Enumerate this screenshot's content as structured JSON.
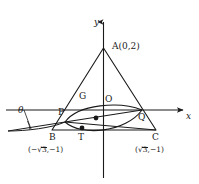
{
  "figure": {
    "axes": {
      "x_label": "x",
      "y_label": "y",
      "x_axis_y": 110,
      "y_axis_x": 103.5
    },
    "points": [
      {
        "id": "A",
        "label": "A(0,2)",
        "px": 103.5,
        "py": 48,
        "label_x": 112,
        "label_y": 42,
        "dot": false
      },
      {
        "id": "B",
        "label": "B",
        "px": 52,
        "py": 130,
        "label_x": 49,
        "label_y": 133,
        "dot": false
      },
      {
        "id": "C",
        "label": "C",
        "px": 156,
        "py": 130,
        "label_x": 152,
        "label_y": 133,
        "dot": false
      },
      {
        "id": "P",
        "label": "P",
        "px": 65,
        "py": 122,
        "label_x": 58,
        "label_y": 108,
        "dot": false
      },
      {
        "id": "Q",
        "label": "Q",
        "px": 142,
        "py": 110,
        "label_x": 138,
        "label_y": 113,
        "dot": false
      },
      {
        "id": "G",
        "label": "G",
        "px": 96,
        "py": 118,
        "label_x": 79,
        "label_y": 92,
        "dot": true
      },
      {
        "id": "T",
        "label": "T",
        "px": 82,
        "py": 128,
        "label_x": 78,
        "label_y": 133,
        "dot": true
      },
      {
        "id": "O",
        "label": "O",
        "px": 103.5,
        "py": 110,
        "label_x": 105,
        "label_y": 95,
        "dot": false
      }
    ],
    "coord_labels": [
      {
        "id": "B-coord",
        "prefix": "(−",
        "radical": "3",
        "suffix": ",−1)",
        "x": 28,
        "y": 147
      },
      {
        "id": "C-coord",
        "prefix": "(",
        "radical": "3",
        "suffix": ",−1)",
        "x": 135,
        "y": 147
      }
    ],
    "angle": {
      "symbol": "θ",
      "x": 18,
      "y": 107
    },
    "colors": {
      "stroke": "#1a1a1a",
      "background": "#ffffff",
      "text": "#1a1a1a"
    }
  }
}
